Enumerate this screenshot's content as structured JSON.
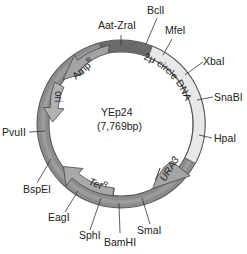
{
  "plasmid": {
    "name": "YEp24",
    "size_label": "(7,769bp)",
    "colors": {
      "backbone": "#8a8a8a",
      "backbone_dark": "#6e6e6e",
      "feature_arrow": "#a9a9a9",
      "two_micron": "#e6e6e6",
      "outline": "#444444",
      "text": "#222222"
    },
    "features": [
      {
        "name": "2μ circle DNA",
        "label": "2μ circle DNA"
      },
      {
        "name": "URA3",
        "label": "URA3"
      },
      {
        "name": "TetR",
        "label": "Tet",
        "sup": "R"
      },
      {
        "name": "ori",
        "label": "ori"
      },
      {
        "name": "AmpR",
        "label": "Amp",
        "sup": "R"
      }
    ],
    "sites": [
      {
        "name": "Aat-ZraI"
      },
      {
        "name": "BclI"
      },
      {
        "name": "MfeI"
      },
      {
        "name": "XbaI"
      },
      {
        "name": "SnaBI"
      },
      {
        "name": "HpaI"
      },
      {
        "name": "SmaI"
      },
      {
        "name": "BamHI"
      },
      {
        "name": "SphI"
      },
      {
        "name": "EagI"
      },
      {
        "name": "BspEI"
      },
      {
        "name": "PvuII"
      }
    ]
  }
}
